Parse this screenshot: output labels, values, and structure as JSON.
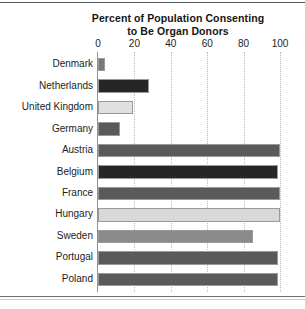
{
  "figure": {
    "background_color": "#ffffff",
    "top_rule_color": "#55585b",
    "bottom_rule_color": "#6b6e70"
  },
  "title": {
    "line1": "Percent of Population Consenting",
    "line2": "to Be Organ Donors"
  },
  "chart_data": {
    "type": "bar",
    "orientation": "horizontal",
    "title": "Percent of Population Consenting to Be Organ Donors",
    "xlabel": "",
    "ylabel": "",
    "xlim": [
      0,
      100
    ],
    "xticks": [
      0,
      20,
      40,
      60,
      80,
      100
    ],
    "xtick_labels": [
      "0",
      "20",
      "40",
      "60",
      "80",
      "100"
    ],
    "grid": "vertical-dotted",
    "legend": "none",
    "categories": [
      "Denmark",
      "Netherlands",
      "United Kingdom",
      "Germany",
      "Austria",
      "Belgium",
      "France",
      "Hungary",
      "Sweden",
      "Portugal",
      "Poland"
    ],
    "values": [
      4,
      28,
      19,
      12,
      100,
      99,
      100,
      100,
      85,
      99,
      99
    ],
    "bar_colors": [
      "#787878",
      "#262626",
      "#e0e0e0",
      "#5a5a5a",
      "#5a5a5a",
      "#262626",
      "#5a5a5a",
      "#d9d9d9",
      "#8a8a8a",
      "#5a5a5a",
      "#5a5a5a"
    ]
  }
}
